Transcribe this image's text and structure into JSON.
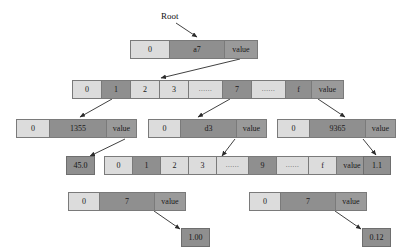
{
  "diagram": {
    "root_label": "Root",
    "colors": {
      "light_cell": "#dcdcdc",
      "dark_cell": "#8f8f8f",
      "value_cell": "#9a9a9a",
      "border": "#7a7a7a",
      "background": "#ffffff",
      "text": "#1a1a1a"
    },
    "nodes": {
      "root": {
        "name": "root-extension-node",
        "cells": [
          {
            "text": "0",
            "style": "light"
          },
          {
            "text": "a7",
            "style": "dark"
          },
          {
            "text": "value",
            "style": "value"
          }
        ]
      },
      "branch_top": {
        "name": "branch-node-level2",
        "cells": [
          {
            "text": "0",
            "style": "light"
          },
          {
            "text": "1",
            "style": "dark"
          },
          {
            "text": "2",
            "style": "light"
          },
          {
            "text": "3",
            "style": "light"
          },
          {
            "text": "......",
            "style": "light"
          },
          {
            "text": "7",
            "style": "dark"
          },
          {
            "text": "......",
            "style": "light"
          },
          {
            "text": "f",
            "style": "dark"
          },
          {
            "text": "value",
            "style": "value"
          }
        ]
      },
      "ext_1355": {
        "name": "extension-node-1355",
        "cells": [
          {
            "text": "0",
            "style": "light"
          },
          {
            "text": "1355",
            "style": "dark"
          },
          {
            "text": "value",
            "style": "value"
          }
        ]
      },
      "ext_d3": {
        "name": "extension-node-d3",
        "cells": [
          {
            "text": "0",
            "style": "light"
          },
          {
            "text": "d3",
            "style": "dark"
          },
          {
            "text": "value",
            "style": "value"
          }
        ]
      },
      "ext_9365": {
        "name": "extension-node-9365",
        "cells": [
          {
            "text": "0",
            "style": "light"
          },
          {
            "text": "9365",
            "style": "dark"
          },
          {
            "text": "value",
            "style": "value"
          }
        ]
      },
      "branch_bottom": {
        "name": "branch-node-level4",
        "cells": [
          {
            "text": "0",
            "style": "light"
          },
          {
            "text": "1",
            "style": "dark"
          },
          {
            "text": "2",
            "style": "light"
          },
          {
            "text": "3",
            "style": "light"
          },
          {
            "text": "......",
            "style": "light"
          },
          {
            "text": "9",
            "style": "dark"
          },
          {
            "text": "......",
            "style": "light"
          },
          {
            "text": "f",
            "style": "light"
          },
          {
            "text": "value",
            "style": "value"
          }
        ]
      },
      "leaf_left": {
        "name": "leaf-node-left",
        "cells": [
          {
            "text": "0",
            "style": "light"
          },
          {
            "text": "7",
            "style": "dark"
          },
          {
            "text": "value",
            "style": "value"
          }
        ]
      },
      "leaf_right": {
        "name": "leaf-node-right",
        "cells": [
          {
            "text": "0",
            "style": "light"
          },
          {
            "text": "7",
            "style": "dark"
          },
          {
            "text": "value",
            "style": "value"
          }
        ]
      }
    },
    "value_boxes": {
      "v_45_0": "45.0",
      "v_1_1": "1.1",
      "v_1_00": "1.00",
      "v_0_12": "0.12"
    }
  }
}
